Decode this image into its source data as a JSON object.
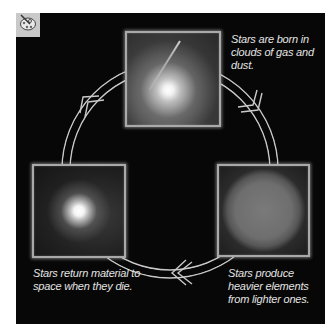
{
  "badge": {
    "icon": "palette-icon"
  },
  "diagram": {
    "colors": {
      "background": "#070707",
      "frame": "#a9a9a9",
      "text": "#e4e4e4",
      "badge": "#c9c9c9"
    },
    "stages": [
      {
        "id": "birth",
        "image": "nebula-star-forming",
        "caption": "Stars are born in clouds of gas and dust.",
        "position": "top"
      },
      {
        "id": "fusion",
        "image": "sun-disk",
        "caption": "Stars produce heavier elements from lighter ones.",
        "position": "bottom-right"
      },
      {
        "id": "death",
        "image": "supernova-remnant",
        "caption": "Stars return material to space when they die.",
        "position": "bottom-left"
      }
    ],
    "arrows": [
      {
        "from": "birth",
        "to": "fusion",
        "direction": "clockwise"
      },
      {
        "from": "fusion",
        "to": "death",
        "direction": "clockwise"
      },
      {
        "from": "death",
        "to": "birth",
        "direction": "clockwise"
      }
    ]
  }
}
